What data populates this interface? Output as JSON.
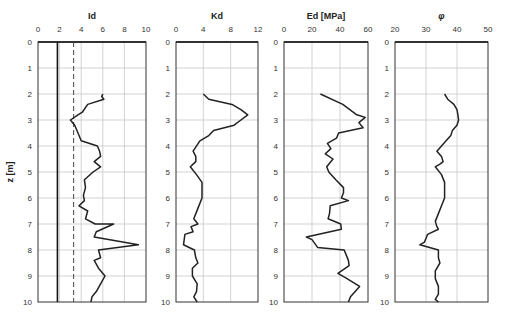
{
  "chart_data": [
    {
      "type": "line",
      "title": "Id",
      "xlabel": "Id",
      "ylabel": "z [m]",
      "xlim": [
        0,
        10
      ],
      "xticks": [
        0,
        2,
        4,
        6,
        8,
        10
      ],
      "ylim": [
        0,
        10
      ],
      "yticks": [
        0,
        1,
        2,
        3,
        4,
        5,
        6,
        7,
        8,
        9,
        10
      ],
      "grid": true,
      "reference_lines": [
        {
          "x": 1.8,
          "style": "solid"
        },
        {
          "x": 3.3,
          "style": "dashed"
        }
      ],
      "series": [
        {
          "name": "Id",
          "points": [
            [
              6.0,
              2.0
            ],
            [
              5.9,
              2.1
            ],
            [
              6.1,
              2.2
            ],
            [
              4.6,
              2.4
            ],
            [
              4.1,
              2.7
            ],
            [
              3.7,
              2.8
            ],
            [
              3.0,
              3.0
            ],
            [
              3.4,
              3.2
            ],
            [
              3.7,
              3.5
            ],
            [
              4.0,
              3.8
            ],
            [
              5.5,
              4.0
            ],
            [
              5.7,
              4.2
            ],
            [
              5.8,
              4.4
            ],
            [
              5.2,
              4.6
            ],
            [
              5.8,
              4.8
            ],
            [
              5.1,
              5.0
            ],
            [
              4.3,
              5.3
            ],
            [
              4.4,
              5.6
            ],
            [
              4.2,
              5.9
            ],
            [
              4.3,
              6.1
            ],
            [
              3.8,
              6.3
            ],
            [
              4.6,
              6.5
            ],
            [
              4.4,
              6.8
            ],
            [
              5.3,
              7.0
            ],
            [
              7.0,
              7.0
            ],
            [
              5.4,
              7.3
            ],
            [
              5.2,
              7.5
            ],
            [
              9.3,
              7.8
            ],
            [
              5.6,
              8.0
            ],
            [
              5.8,
              8.3
            ],
            [
              5.2,
              8.4
            ],
            [
              5.6,
              8.7
            ],
            [
              6.2,
              9.0
            ],
            [
              5.8,
              9.3
            ],
            [
              5.4,
              9.6
            ],
            [
              5.0,
              9.8
            ],
            [
              4.9,
              10.0
            ]
          ]
        }
      ]
    },
    {
      "type": "line",
      "title": "Kd",
      "xlabel": "Kd",
      "xlim": [
        0,
        12
      ],
      "xticks": [
        0,
        4,
        8,
        12
      ],
      "ylim": [
        0,
        10
      ],
      "grid": true,
      "series": [
        {
          "name": "Kd",
          "points": [
            [
              4.0,
              2.0
            ],
            [
              4.8,
              2.2
            ],
            [
              8.2,
              2.4
            ],
            [
              9.5,
              2.6
            ],
            [
              10.5,
              2.8
            ],
            [
              9.5,
              3.0
            ],
            [
              8.5,
              3.2
            ],
            [
              5.5,
              3.4
            ],
            [
              4.8,
              3.6
            ],
            [
              3.5,
              3.8
            ],
            [
              2.5,
              4.2
            ],
            [
              2.9,
              4.4
            ],
            [
              2.9,
              4.6
            ],
            [
              2.1,
              4.8
            ],
            [
              3.0,
              5.1
            ],
            [
              3.8,
              5.4
            ],
            [
              3.8,
              5.8
            ],
            [
              3.8,
              6.0
            ],
            [
              3.2,
              6.4
            ],
            [
              2.6,
              6.8
            ],
            [
              3.2,
              7.0
            ],
            [
              2.2,
              7.1
            ],
            [
              2.5,
              7.3
            ],
            [
              1.3,
              7.4
            ],
            [
              1.1,
              7.8
            ],
            [
              2.7,
              8.0
            ],
            [
              2.9,
              8.3
            ],
            [
              3.2,
              8.5
            ],
            [
              2.4,
              8.7
            ],
            [
              2.4,
              9.0
            ],
            [
              3.1,
              9.3
            ],
            [
              3.0,
              9.6
            ],
            [
              2.6,
              9.8
            ],
            [
              3.1,
              10.0
            ]
          ]
        }
      ]
    },
    {
      "type": "line",
      "title": "Ed [MPa]",
      "xlabel": "Ed [MPa]",
      "xlim": [
        0,
        60
      ],
      "xticks": [
        0,
        20,
        40,
        60
      ],
      "ylim": [
        0,
        10
      ],
      "grid": true,
      "series": [
        {
          "name": "Ed",
          "points": [
            [
              26.0,
              2.0
            ],
            [
              42.0,
              2.4
            ],
            [
              52.0,
              2.8
            ],
            [
              58.0,
              2.9
            ],
            [
              53.5,
              3.1
            ],
            [
              56.5,
              3.3
            ],
            [
              39.0,
              3.5
            ],
            [
              37.5,
              3.7
            ],
            [
              31.0,
              3.9
            ],
            [
              33.5,
              4.1
            ],
            [
              29.5,
              4.3
            ],
            [
              35.0,
              4.5
            ],
            [
              30.5,
              4.8
            ],
            [
              32.0,
              5.0
            ],
            [
              37.0,
              5.3
            ],
            [
              42.5,
              5.6
            ],
            [
              42.5,
              5.8
            ],
            [
              41.0,
              6.0
            ],
            [
              46.0,
              6.1
            ],
            [
              33.0,
              6.3
            ],
            [
              32.5,
              6.6
            ],
            [
              31.5,
              6.8
            ],
            [
              40.5,
              7.0
            ],
            [
              41.0,
              7.2
            ],
            [
              16.0,
              7.5
            ],
            [
              20.0,
              7.6
            ],
            [
              24.0,
              7.9
            ],
            [
              43.0,
              8.0
            ],
            [
              46.0,
              8.4
            ],
            [
              46.5,
              8.6
            ],
            [
              38.5,
              8.9
            ],
            [
              45.0,
              9.1
            ],
            [
              54.0,
              9.4
            ],
            [
              47.5,
              9.8
            ],
            [
              46.0,
              10.0
            ]
          ]
        }
      ]
    },
    {
      "type": "line",
      "title": "φ",
      "xlabel": "φ",
      "xlim": [
        20,
        50
      ],
      "xticks": [
        20,
        30,
        40,
        50
      ],
      "ylim": [
        0,
        10
      ],
      "grid": true,
      "series": [
        {
          "name": "phi",
          "points": [
            [
              36.0,
              2.0
            ],
            [
              37.0,
              2.2
            ],
            [
              39.0,
              2.4
            ],
            [
              40.0,
              2.6
            ],
            [
              40.3,
              2.8
            ],
            [
              40.5,
              3.0
            ],
            [
              40.0,
              3.2
            ],
            [
              38.5,
              3.4
            ],
            [
              38.0,
              3.6
            ],
            [
              36.5,
              3.8
            ],
            [
              35.0,
              4.0
            ],
            [
              33.5,
              4.2
            ],
            [
              35.0,
              4.4
            ],
            [
              35.5,
              4.6
            ],
            [
              34.5,
              4.7
            ],
            [
              33.0,
              4.8
            ],
            [
              35.0,
              5.1
            ],
            [
              36.0,
              5.4
            ],
            [
              36.0,
              5.8
            ],
            [
              36.0,
              6.0
            ],
            [
              35.0,
              6.3
            ],
            [
              34.0,
              6.6
            ],
            [
              33.0,
              6.9
            ],
            [
              33.5,
              7.1
            ],
            [
              34.0,
              7.2
            ],
            [
              30.5,
              7.4
            ],
            [
              29.5,
              7.7
            ],
            [
              28.0,
              7.8
            ],
            [
              34.0,
              8.0
            ],
            [
              34.0,
              8.3
            ],
            [
              34.5,
              8.5
            ],
            [
              33.0,
              8.8
            ],
            [
              33.0,
              9.1
            ],
            [
              34.0,
              9.4
            ],
            [
              34.0,
              9.7
            ],
            [
              33.0,
              9.9
            ],
            [
              34.0,
              10.0
            ]
          ]
        }
      ]
    }
  ],
  "axis": {
    "y_label": "z [m]",
    "y_ticks": [
      "0",
      "1",
      "2",
      "3",
      "4",
      "5",
      "6",
      "7",
      "8",
      "9",
      "10"
    ]
  },
  "colors": {
    "line": "#222222",
    "grid": "#c8c8c8",
    "frame": "#333333",
    "reference": "#444444"
  }
}
